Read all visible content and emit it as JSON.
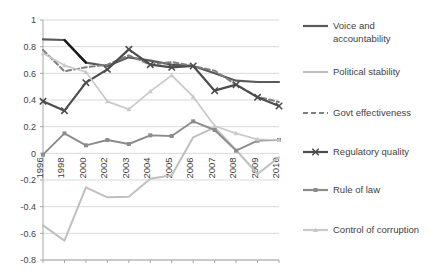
{
  "chart_data": {
    "type": "line",
    "title": "",
    "subtitle": "",
    "xlabel": "",
    "ylabel": "",
    "categories": [
      "1996",
      "1998",
      "2000",
      "2002",
      "2003",
      "2004",
      "2005",
      "2006",
      "2007",
      "2008",
      "2009",
      "2010"
    ],
    "ylim": [
      -0.8,
      1
    ],
    "ytick_step": 0.2,
    "yticks": [
      "1",
      "0.8",
      "0.6",
      "0.4",
      "0.2",
      "0",
      "-0.2",
      "-0.4",
      "-0.6",
      "-0.8"
    ],
    "ytick_values": [
      1,
      0.8,
      0.6,
      0.4,
      0.2,
      0,
      -0.2,
      -0.4,
      -0.6,
      -0.8
    ],
    "grid": true,
    "grid_axis": "y",
    "legend_position": "right",
    "series": [
      {
        "name": "Voice and accountability",
        "color": "#595959",
        "style": "solid",
        "marker": "none",
        "width": 2.2,
        "values": [
          0.855,
          0.85,
          0.68,
          0.655,
          0.72,
          0.695,
          0.665,
          0.655,
          0.6,
          0.545,
          0.535,
          0.535
        ]
      },
      {
        "name": "Political stability",
        "color": "#bfbfbf",
        "style": "solid",
        "marker": "none",
        "width": 2.0,
        "values": [
          -0.54,
          -0.655,
          -0.255,
          -0.33,
          -0.325,
          -0.19,
          -0.165,
          0.12,
          0.195,
          0.025,
          -0.155,
          -0.03
        ]
      },
      {
        "name": "Govt effectiveness",
        "color": "#808080",
        "style": "dashed",
        "marker": "none",
        "width": 2.0,
        "values": [
          0.775,
          0.615,
          0.645,
          0.665,
          0.735,
          0.665,
          0.685,
          0.655,
          0.62,
          0.515,
          0.425,
          0.385
        ]
      },
      {
        "name": "Regulatory quality",
        "color": "#4d4d4d",
        "style": "solid",
        "marker": "x",
        "width": 2.2,
        "values": [
          0.39,
          0.32,
          0.53,
          0.63,
          0.78,
          0.665,
          0.645,
          0.655,
          0.47,
          0.515,
          0.42,
          0.355
        ]
      },
      {
        "name": "Rule of law",
        "color": "#8c8c8c",
        "style": "solid",
        "marker": "square",
        "width": 1.9,
        "values": [
          -0.01,
          0.15,
          0.06,
          0.1,
          0.07,
          0.135,
          0.13,
          0.24,
          0.175,
          0.02,
          0.095,
          0.1
        ]
      },
      {
        "name": "Control of corruption",
        "color": "#c9c9c9",
        "style": "solid",
        "marker": "triangle",
        "width": 1.7,
        "values": [
          0.75,
          0.66,
          0.61,
          0.39,
          0.33,
          0.465,
          0.585,
          0.425,
          0.205,
          0.15,
          0.105,
          0.1
        ]
      }
    ]
  },
  "legend": {
    "items": [
      {
        "label": "Voice and accountability",
        "color": "#595959",
        "style": "solid",
        "marker": "none"
      },
      {
        "label": "Political stability",
        "color": "#bfbfbf",
        "style": "solid",
        "marker": "none"
      },
      {
        "label": "Govt effectiveness",
        "color": "#808080",
        "style": "dashed",
        "marker": "none"
      },
      {
        "label": "Regulatory quality",
        "color": "#4d4d4d",
        "style": "solid",
        "marker": "x"
      },
      {
        "label": "Rule of law",
        "color": "#8c8c8c",
        "style": "solid",
        "marker": "square"
      },
      {
        "label": "Control of corruption",
        "color": "#c9c9c9",
        "style": "solid",
        "marker": "triangle"
      }
    ]
  },
  "axis": {
    "line_color": "#a6a6a6",
    "grid_color": "#d9d9d9",
    "text_color": "#3f3f3f"
  }
}
